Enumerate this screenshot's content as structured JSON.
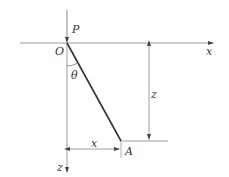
{
  "diagram": {
    "labels": {
      "force": "P",
      "origin": "O",
      "angle": "θ",
      "x_axis": "x",
      "z_axis": "z",
      "z_dimension": "z",
      "x_dimension": "x",
      "point": "A"
    },
    "colors": {
      "axis": "#9a9a9a",
      "line": "#333333",
      "text": "#333333"
    }
  }
}
